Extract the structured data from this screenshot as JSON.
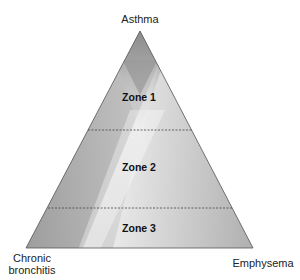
{
  "diagram": {
    "type": "triangle-venn",
    "vertices": {
      "top": "Asthma",
      "bottom_left": "Chronic bronchitis",
      "bottom_left_lines": [
        "Chronic",
        "bronchitis"
      ],
      "bottom_right": "Emphysema"
    },
    "zones": [
      {
        "label": "Zone 1"
      },
      {
        "label": "Zone 2"
      },
      {
        "label": "Zone 3"
      }
    ],
    "colors": {
      "dark_gray": "#7a7a7a",
      "light_gray": "#eeeeee",
      "outline": "#555555",
      "divider": "#444444"
    }
  }
}
